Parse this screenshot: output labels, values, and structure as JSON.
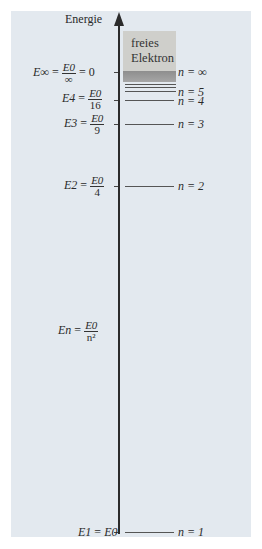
{
  "diagram": {
    "axis_label": "Energie",
    "free_electron": {
      "line1": "freies",
      "line2": "Elektron"
    },
    "levels": [
      {
        "n": "∞",
        "n_label": "n = ∞",
        "energy_lhs": "E∞",
        "energy_num": "E0",
        "energy_den": "∞",
        "energy_tail": "= 0"
      },
      {
        "n": "5",
        "n_label": "n = 5"
      },
      {
        "n": "4",
        "n_label": "n = 4",
        "energy_lhs": "E4",
        "energy_num": "E0",
        "energy_den": "16"
      },
      {
        "n": "3",
        "n_label": "n = 3",
        "energy_lhs": "E3",
        "energy_num": "E0",
        "energy_den": "9"
      },
      {
        "n": "2",
        "n_label": "n = 2",
        "energy_lhs": "E2",
        "energy_num": "E0",
        "energy_den": "4"
      },
      {
        "n": "1",
        "n_label": "n = 1",
        "energy_lhs": "E1",
        "energy_rhs": "E0"
      }
    ],
    "general_formula": {
      "lhs": "En",
      "num": "E0",
      "den": "n²"
    },
    "colors": {
      "background": "#e3e9ef",
      "free_box": "#cfcfcb",
      "band": "#999999",
      "axis": "#2b2b2b"
    }
  }
}
